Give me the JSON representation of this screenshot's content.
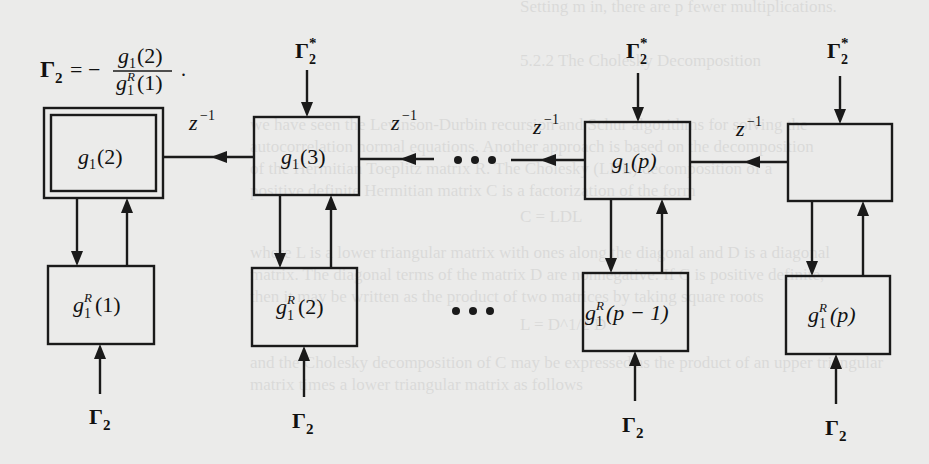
{
  "diagram": {
    "title_equation": {
      "lhs": "Γ",
      "lhs_sub": "2",
      "equals": "= −",
      "numerator": {
        "g": "g",
        "sub": "1",
        "arg": "(2)"
      },
      "denominator": {
        "g": "g",
        "sup": "R",
        "sub": "1",
        "arg": "(1)"
      },
      "trailing": "."
    },
    "top_boxes": [
      {
        "id": "g1_2",
        "g": "g",
        "sub": "1",
        "arg": "(2)",
        "double_border": true
      },
      {
        "id": "g1_3",
        "g": "g",
        "sub": "1",
        "arg": "(3)"
      },
      {
        "id": "g1_p",
        "g": "g",
        "sub": "1",
        "arg": "(p)"
      },
      {
        "id": "g1_empty",
        "g": "",
        "sub": "",
        "arg": ""
      }
    ],
    "bottom_boxes": [
      {
        "id": "gR1_1",
        "g": "g",
        "sup": "R",
        "sub": "1",
        "arg": "(1)"
      },
      {
        "id": "gR1_2",
        "g": "g",
        "sup": "R",
        "sub": "1",
        "arg": "(2)"
      },
      {
        "id": "gR1_pm1",
        "g": "g",
        "sup": "R",
        "sub": "1",
        "arg": "(p − 1)"
      },
      {
        "id": "gR1_p",
        "g": "g",
        "sup": "R",
        "sub": "1",
        "arg": "(p)"
      }
    ],
    "delay_label": {
      "base": "z",
      "exp": "−1"
    },
    "top_input_label": {
      "base": "Γ",
      "sup": "*",
      "sub": "2"
    },
    "bottom_input_label": {
      "base": "Γ",
      "sub": "2"
    },
    "ellipsis": "• • •",
    "colors": {
      "ink": "#1a1a1a",
      "paper": "#ebebea"
    }
  },
  "show_through_text": [
    "Setting m in, there are p fewer multiplications.",
    "5.2.2  The Cholesky Decomposition",
    "we have seen the Levinson-Durbin recursion and Schur algorithms for solving the",
    "autocorrelation normal equations. Another approach is based on the decomposition",
    "of the Hermitian Toeplitz matrix R. The Cholesky (LDL) decomposition of a",
    "positive definite Hermitian matrix C is a factorization of the form",
    "C = LDL",
    "where L is a lower triangular matrix with ones along the diagonal and D is a diagonal",
    "matrix. The diagonal terms of the matrix D are nonnegative. If C is positive definite,",
    "then it may be written as the product of two matrices by taking square roots",
    "L = D^1/2 D",
    "and the Cholesky decomposition of C may be expressed as the product of an upper triangular",
    "matrix times a lower triangular matrix as follows"
  ]
}
